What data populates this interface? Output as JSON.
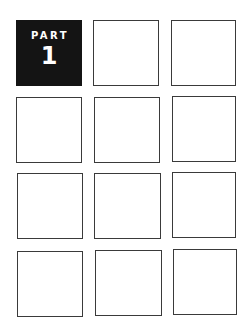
{
  "part_tile": {
    "label": "PART",
    "number": "1",
    "color": "#141414"
  },
  "grid": {
    "rows": 4,
    "columns": 3,
    "border_color": "#3a3a3a"
  }
}
